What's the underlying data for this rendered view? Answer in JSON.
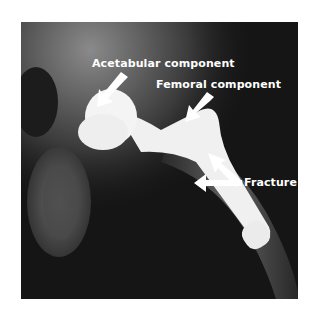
{
  "figure": {
    "annotations": [
      {
        "label": "Acetabular component"
      },
      {
        "label": "Femoral component"
      },
      {
        "label": "Fracture"
      }
    ]
  },
  "colors": {
    "background": "#ffffff",
    "xray_dark": "#151515",
    "implant": "#f2f2f2",
    "annotation": "#ffffff"
  }
}
